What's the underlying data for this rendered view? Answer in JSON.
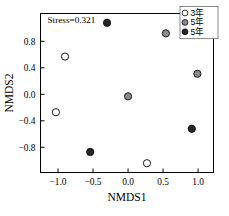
{
  "chart_data": {
    "type": "scatter",
    "title": "",
    "xlabel": "NMDS1",
    "ylabel": "NMDS2",
    "xlim": [
      -1.25,
      1.22
    ],
    "ylim": [
      -1.18,
      1.22
    ],
    "xticks": [
      -1.0,
      -0.5,
      0.0,
      0.5,
      1.0
    ],
    "xtick_labels": [
      "−1.0",
      "−0.5",
      "0.0",
      "0.5",
      "1.0"
    ],
    "yticks": [
      0.8,
      0.4,
      0.0,
      -0.4,
      -0.8
    ],
    "ytick_labels": [
      "0.8",
      "0.4",
      "0.0",
      "−0.4",
      "−0.8"
    ],
    "grid": false,
    "annotation": "Stress=0.321",
    "legend_position": "top-right",
    "series": [
      {
        "name": "3年",
        "marker": "open-circle",
        "fill": "#ffffff",
        "edge": "#1a1a1a",
        "points": [
          {
            "x": -1.03,
            "y": -0.27
          },
          {
            "x": -0.9,
            "y": 0.57
          },
          {
            "x": 0.27,
            "y": -1.04
          }
        ]
      },
      {
        "name": "5年",
        "marker": "gray-circle",
        "fill": "#8a8a8a",
        "edge": "#1a1a1a",
        "points": [
          {
            "x": 0.54,
            "y": 0.92
          },
          {
            "x": 0.99,
            "y": 0.31
          },
          {
            "x": 0.0,
            "y": -0.03
          }
        ]
      },
      {
        "name": "5年",
        "marker": "filled-circle",
        "fill": "#262626",
        "edge": "#111111",
        "points": [
          {
            "x": -0.3,
            "y": 1.08
          },
          {
            "x": -0.54,
            "y": -0.87
          },
          {
            "x": 0.91,
            "y": -0.52
          }
        ]
      }
    ]
  },
  "legend": {
    "entries": [
      {
        "label": "3年",
        "marker": "open-circle"
      },
      {
        "label": "5年",
        "marker": "gray-circle"
      },
      {
        "label": "5年",
        "marker": "filled-circle"
      }
    ]
  },
  "colors": {
    "open_fill": "#ffffff",
    "gray_fill": "#8a8a8a",
    "dark_fill": "#262626",
    "marker_edge": "#1a1a1a",
    "axis": "#000000",
    "background": "#ffffff"
  }
}
